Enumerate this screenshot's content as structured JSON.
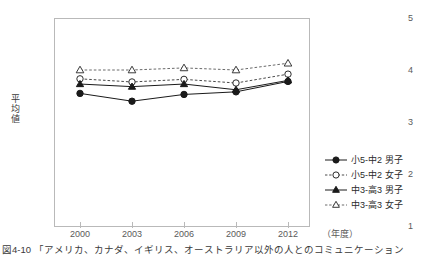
{
  "chart_data": {
    "type": "line",
    "title": "",
    "xlabel": "(年度)",
    "ylabel": "平均値",
    "categories": [
      "2000",
      "2003",
      "2006",
      "2009",
      "2012"
    ],
    "x": [
      2000,
      2003,
      2006,
      2009,
      2012
    ],
    "ylim": [
      1,
      5
    ],
    "yticks": [
      "5",
      "4",
      "3",
      "2",
      "1"
    ],
    "grid": false,
    "legend_position": "right-bottom",
    "series": [
      {
        "name": "小5-中2 男子",
        "marker": "filled-circle",
        "line": "solid",
        "color": "#1a1a1a",
        "values": [
          3.55,
          3.4,
          3.53,
          3.58,
          3.78
        ]
      },
      {
        "name": "小5-中2 女子",
        "marker": "open-circle",
        "line": "dashed",
        "color": "#4a4a4a",
        "values": [
          3.83,
          3.77,
          3.82,
          3.75,
          3.92
        ]
      },
      {
        "name": "中3-高3 男子",
        "marker": "filled-triangle",
        "line": "solid",
        "color": "#1a1a1a",
        "values": [
          3.73,
          3.68,
          3.73,
          3.62,
          3.8
        ]
      },
      {
        "name": "中3-高3 女子",
        "marker": "open-triangle",
        "line": "dashed",
        "color": "#6a6a6a",
        "values": [
          4.0,
          4.0,
          4.04,
          4.0,
          4.13
        ]
      }
    ]
  },
  "axes": {
    "y_label_chars": [
      "平",
      "均",
      "値"
    ],
    "y_ticks": [
      "5",
      "4",
      "3",
      "2",
      "1"
    ],
    "x_ticks": [
      "2000",
      "2003",
      "2006",
      "2009",
      "2012"
    ],
    "x_unit": "（年度）"
  },
  "legend": {
    "items": [
      {
        "label": "小5-中2 男子",
        "marker": "filled-circle",
        "line": "solid"
      },
      {
        "label": "小5-中2 女子",
        "marker": "open-circle",
        "line": "dashed"
      },
      {
        "label": "中3-高3 男子",
        "marker": "filled-triangle",
        "line": "solid"
      },
      {
        "label": "中3-高3 女子",
        "marker": "open-triangle",
        "line": "dashed"
      }
    ]
  },
  "caption": {
    "text": "図4-10 「アメリカ、カナダ、イギリス、オーストラリア以外の人とのコミュニケーション"
  },
  "colors": {
    "frame": "#b9b9b9",
    "text": "#3a3a3a",
    "series_dark": "#1a1a1a",
    "series_mid": "#4a4a4a",
    "series_light": "#6a6a6a"
  }
}
